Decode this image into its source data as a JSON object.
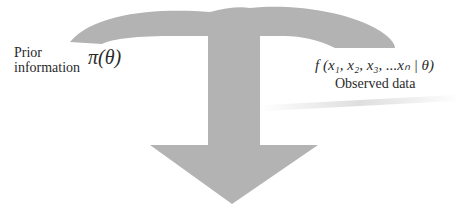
{
  "diagram": {
    "arrow_color": "#b3b3b3",
    "prior": {
      "label_line1": "Prior",
      "label_line2": "information",
      "formula": "π(θ)"
    },
    "likelihood": {
      "formula": "f (x₁, x₂, x₃, ...xₙ | θ)",
      "label": "Observed data"
    }
  }
}
